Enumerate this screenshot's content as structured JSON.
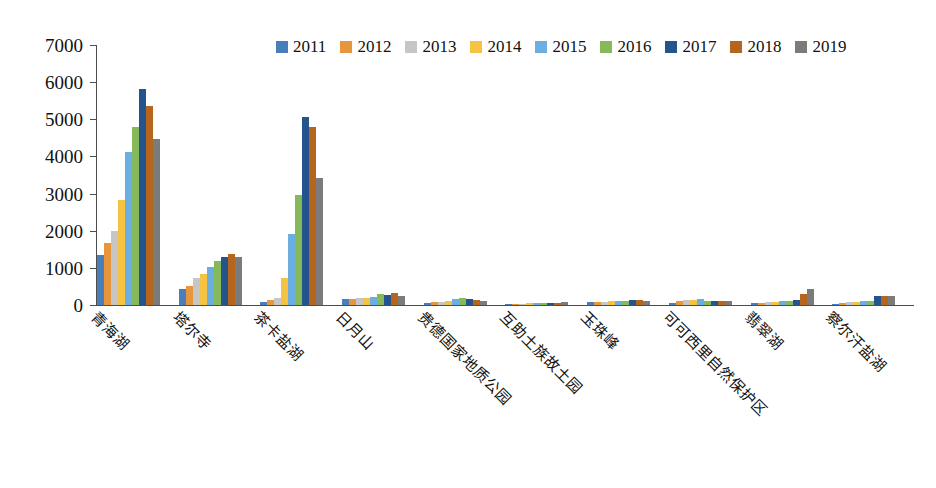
{
  "chart_data": {
    "type": "bar",
    "title": "",
    "xlabel": "",
    "ylabel": "",
    "ylim": [
      0,
      7000
    ],
    "ytick_step": 1000,
    "yticks": [
      0,
      1000,
      2000,
      3000,
      4000,
      5000,
      6000,
      7000
    ],
    "grid": false,
    "legend_position": "top-center",
    "categories": [
      "青海湖",
      "塔尔寺",
      "茶卡盐湖",
      "日月山",
      "贵德国家地质公园",
      "互助土族故土园",
      "玉珠峰",
      "可可西里自然保护区",
      "翡翠湖",
      "察尔汗盐湖"
    ],
    "series": [
      {
        "name": "2011",
        "color": "#4A7EBB",
        "values": [
          1350,
          420,
          90,
          150,
          60,
          30,
          70,
          50,
          45,
          40
        ]
      },
      {
        "name": "2012",
        "color": "#E8963C",
        "values": [
          1680,
          520,
          130,
          165,
          70,
          35,
          80,
          110,
          60,
          55
        ]
      },
      {
        "name": "2013",
        "color": "#C6C6C6",
        "values": [
          1980,
          740,
          190,
          180,
          85,
          40,
          90,
          130,
          75,
          70
        ]
      },
      {
        "name": "2014",
        "color": "#F5C242",
        "values": [
          2820,
          840,
          730,
          195,
          110,
          45,
          95,
          145,
          85,
          80
        ]
      },
      {
        "name": "2015",
        "color": "#6BAEE0",
        "values": [
          4120,
          1030,
          1900,
          215,
          150,
          50,
          105,
          160,
          100,
          95
        ]
      },
      {
        "name": "2016",
        "color": "#86B95A",
        "values": [
          4780,
          1180,
          2950,
          290,
          190,
          55,
          120,
          95,
          115,
          120
        ]
      },
      {
        "name": "2017",
        "color": "#23558C",
        "values": [
          5810,
          1280,
          5060,
          265,
          160,
          60,
          130,
          110,
          140,
          230
        ]
      },
      {
        "name": "2018",
        "color": "#B5651D",
        "values": [
          5350,
          1380,
          4800,
          320,
          130,
          65,
          125,
          120,
          300,
          240
        ]
      },
      {
        "name": "2019",
        "color": "#7B7B7B",
        "values": [
          4470,
          1290,
          3430,
          230,
          115,
          70,
          115,
          105,
          440,
          245
        ]
      }
    ]
  }
}
